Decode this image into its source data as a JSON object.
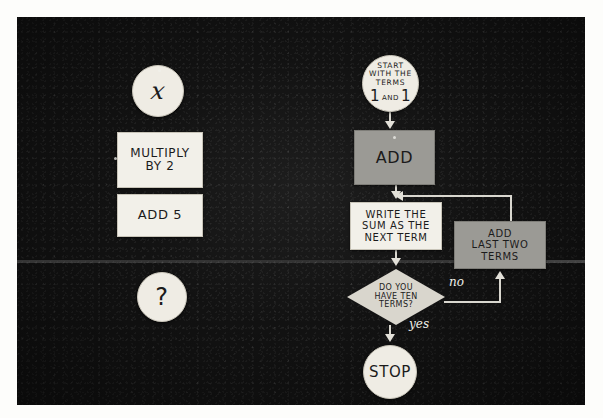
{
  "photo": {
    "caption_present": false,
    "background_color": "#121212",
    "medium": "photograph of a chalkboard flowchart made from paper cards"
  },
  "left_column": {
    "nodes": [
      {
        "id": "x",
        "shape": "circle",
        "text": "x",
        "kind": "variable"
      },
      {
        "id": "multiply",
        "shape": "rectangle",
        "text": "MULTIPLY BY 2",
        "line1": "MULTIPLY",
        "line2": "BY 2"
      },
      {
        "id": "add5",
        "shape": "rectangle",
        "text": "ADD 5"
      },
      {
        "id": "question",
        "shape": "circle",
        "text": "?"
      }
    ]
  },
  "flowchart": {
    "title": "Fibonacci sequence flowchart",
    "nodes": [
      {
        "id": "start",
        "shape": "circle",
        "kind": "terminator",
        "text": "START WITH THE TERMS 1 AND 1",
        "line1": "START",
        "line2": "WITH THE",
        "line3": "TERMS",
        "num1": "1",
        "and": "AND",
        "num2": "1"
      },
      {
        "id": "add",
        "shape": "rectangle",
        "kind": "process",
        "text": "ADD"
      },
      {
        "id": "write",
        "shape": "rectangle",
        "kind": "process",
        "text": "WRITE THE SUM AS THE NEXT TERM",
        "line1": "WRITE THE",
        "line2": "SUM AS THE",
        "line3": "NEXT TERM"
      },
      {
        "id": "addlast",
        "shape": "rectangle",
        "kind": "process",
        "text": "ADD LAST TWO TERMS",
        "line1": "ADD",
        "line2": "LAST TWO",
        "line3": "TERMS"
      },
      {
        "id": "decide",
        "shape": "diamond",
        "kind": "decision",
        "text": "DO YOU HAVE TEN TERMS?",
        "line1": "DO YOU",
        "line2": "HAVE TEN",
        "line3": "TERMS?"
      },
      {
        "id": "stop",
        "shape": "circle",
        "kind": "terminator",
        "text": "STOP"
      }
    ],
    "edges": [
      {
        "from": "start",
        "to": "add",
        "label": ""
      },
      {
        "from": "add",
        "to": "write",
        "label": ""
      },
      {
        "from": "write",
        "to": "decide",
        "label": ""
      },
      {
        "from": "decide",
        "to": "addlast",
        "label": "no"
      },
      {
        "from": "addlast",
        "to": "write",
        "label": ""
      },
      {
        "from": "decide",
        "to": "stop",
        "label": "yes"
      }
    ],
    "edge_labels": {
      "no": "no",
      "yes": "yes"
    }
  }
}
